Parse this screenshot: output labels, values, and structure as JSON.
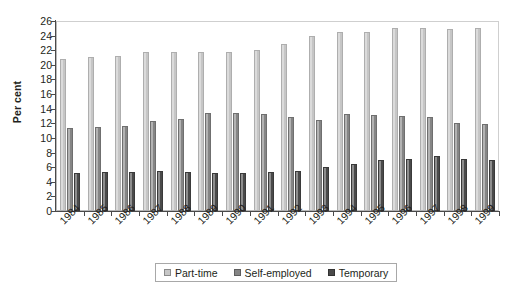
{
  "chart_data": {
    "type": "bar",
    "title": "",
    "xlabel": "",
    "ylabel": "Per cent",
    "ylim": [
      0,
      26
    ],
    "ytick_step": 2,
    "yticks": [
      26,
      24,
      22,
      20,
      18,
      16,
      14,
      12,
      10,
      8,
      6,
      4,
      2,
      0
    ],
    "grid": false,
    "legend_position": "bottom",
    "categories": [
      "1984",
      "1985",
      "1986",
      "1987",
      "1988",
      "1989",
      "1990",
      "1991",
      "1992",
      "1993",
      "1994",
      "1995",
      "1996",
      "1997",
      "1998",
      "1999"
    ],
    "series": [
      {
        "name": "Part-time",
        "color": "#c6c6c6",
        "values": [
          20.8,
          21.1,
          21.2,
          21.8,
          21.7,
          21.8,
          21.8,
          22.1,
          22.9,
          23.9,
          24.5,
          24.5,
          25.0,
          25.1,
          24.9,
          25.0
        ]
      },
      {
        "name": "Self-employed",
        "color": "#858585",
        "values": [
          11.3,
          11.5,
          11.6,
          12.3,
          12.6,
          13.4,
          13.4,
          13.3,
          12.9,
          12.5,
          13.3,
          13.1,
          13.0,
          12.8,
          12.1,
          11.9
        ]
      },
      {
        "name": "Temporary",
        "color": "#4a4a4a",
        "values": [
          5.2,
          5.3,
          5.3,
          5.5,
          5.4,
          5.2,
          5.2,
          5.3,
          5.5,
          6.0,
          6.5,
          7.0,
          7.1,
          7.5,
          7.1,
          7.0
        ]
      }
    ]
  },
  "legend": {
    "items": [
      {
        "label": "Part-time",
        "swatch": "legend-swatch-part-time"
      },
      {
        "label": "Self-employed",
        "swatch": "legend-swatch-self-employed"
      },
      {
        "label": "Temporary",
        "swatch": "legend-swatch-temporary"
      }
    ]
  },
  "axes": {
    "y_title": "Per cent"
  }
}
